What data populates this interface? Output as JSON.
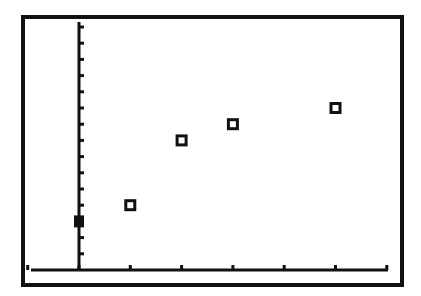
{
  "screen": {
    "background": "#ffffff",
    "ink": "#111111",
    "frame": {
      "left": 23,
      "top": 17,
      "right": 402,
      "bottom": 285,
      "stroke": 4
    }
  },
  "chart_data": {
    "type": "scatter",
    "title": "",
    "xlabel": "",
    "ylabel": "",
    "grid": false,
    "legend": null,
    "xlim": [
      -1,
      6
    ],
    "ylim": [
      0,
      15
    ],
    "x_tick_step": 1,
    "y_tick_step": 1,
    "x_ticks": [
      -1,
      0,
      1,
      2,
      3,
      4,
      5,
      6
    ],
    "y_ticks": [
      1,
      2,
      3,
      4,
      5,
      6,
      7,
      8,
      9,
      10,
      11,
      12,
      13,
      14,
      15
    ],
    "marker": "hollow-square",
    "points": [
      {
        "x": 1,
        "y": 4
      },
      {
        "x": 2,
        "y": 8
      },
      {
        "x": 3,
        "y": 9
      },
      {
        "x": 5,
        "y": 10
      }
    ],
    "cursor": {
      "x": 0,
      "y": 3,
      "marker": "filled-square"
    }
  },
  "plot_geometry": {
    "origin_px": [
      79,
      270
    ],
    "x_unit_px": 51.3,
    "y_unit_px": 16.2,
    "y_axis_top_px": 22,
    "x_axis_left_px": 31,
    "x_axis_right_px": 388
  }
}
